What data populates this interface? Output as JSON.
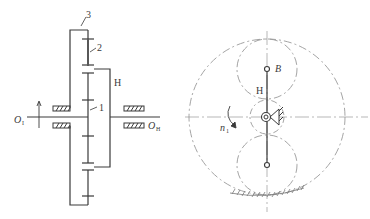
{
  "figure": {
    "left_view": {
      "title": "Planetary gear train – side section",
      "labels": {
        "ring_gear": "3",
        "planet_gear": "2",
        "sun_gear": "1",
        "carrier": "H",
        "input_shaft": "O",
        "input_shaft_sub": "I",
        "output_shaft": "O",
        "output_shaft_sub": "H"
      }
    },
    "right_view": {
      "title": "Planetary gear train – front view",
      "labels": {
        "planet_center": "B",
        "carrier": "H",
        "speed": "n",
        "speed_sub": "1"
      }
    },
    "colors": {
      "line": "#3a3a3a",
      "dashed": "#9a9a9a",
      "background": "#ffffff"
    }
  }
}
